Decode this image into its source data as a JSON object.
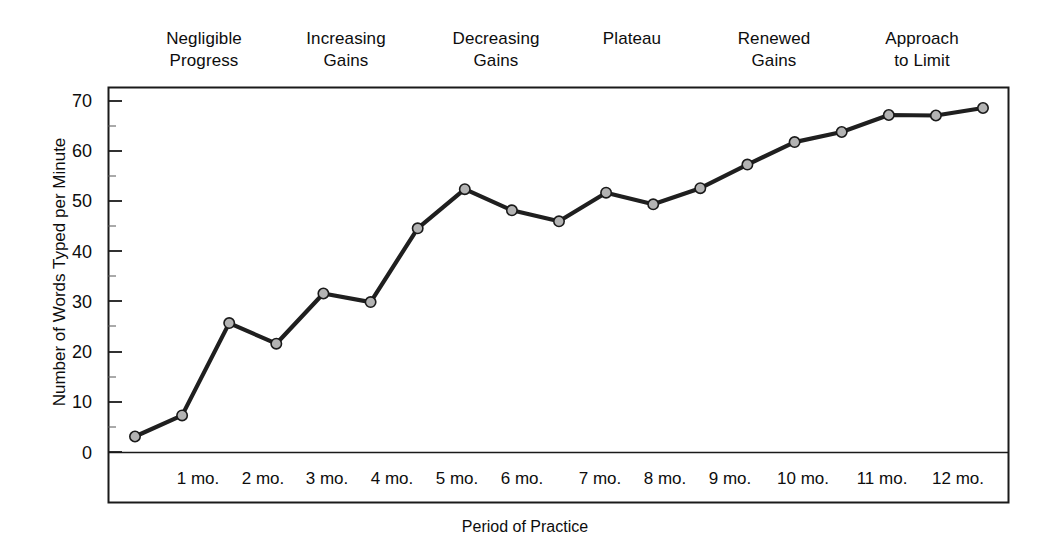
{
  "chart_data": {
    "type": "line",
    "title": "",
    "xlabel": "Period of Practice",
    "ylabel": "Number of Words Typed per Minute",
    "x_tick_labels": [
      "1 mo.",
      "2 mo.",
      "3 mo.",
      "4 mo.",
      "5 mo.",
      "6 mo.",
      "7 mo.",
      "8 mo.",
      "9 mo.",
      "10 mo.",
      "11 mo.",
      "12 mo."
    ],
    "y_tick_labels": [
      "0",
      "10",
      "20",
      "30",
      "40",
      "50",
      "60",
      "70"
    ],
    "y_ticks": [
      0,
      10,
      20,
      30,
      40,
      50,
      60,
      70
    ],
    "ylim": [
      0,
      72
    ],
    "grid": false,
    "legend": null,
    "marker": "circle",
    "line_color": "#1a1a1a",
    "marker_fill": "#b3b3b3",
    "marker_stroke": "#1a1a1a",
    "x": [
      0,
      1,
      2,
      3,
      4,
      5,
      6,
      7,
      8,
      9,
      10,
      11,
      12
    ],
    "values": [
      3.2,
      7.4,
      25.8,
      21.7,
      31.7,
      30.0,
      44.7,
      52.5,
      48.3,
      46.1,
      51.8,
      49.5,
      52.7
    ],
    "series": [
      {
        "name": "Words typed per minute",
        "points": [
          {
            "x": 0,
            "x_label": "",
            "y": 3.2
          },
          {
            "x": 1,
            "x_label": "1 mo.",
            "y": 7.4
          },
          {
            "x": 2,
            "x_label": "2 mo.",
            "y": 25.8
          },
          {
            "x": 3,
            "x_label": "",
            "y": 21.7
          },
          {
            "x": 4,
            "x_label": "3 mo.",
            "y": 31.7
          },
          {
            "x": 5,
            "x_label": "",
            "y": 30.0
          },
          {
            "x": 6,
            "x_label": "4 mo.",
            "y": 44.7
          },
          {
            "x": 7,
            "x_label": "",
            "y": 52.5
          },
          {
            "x": 8,
            "x_label": "5 mo.",
            "y": 48.3
          },
          {
            "x": 9,
            "x_label": "6 mo.",
            "y": 46.1
          },
          {
            "x": 10,
            "x_label": "7 mo.",
            "y": 51.8
          },
          {
            "x": 11,
            "x_label": "",
            "y": 49.5
          },
          {
            "x": 12,
            "x_label": "8 mo.",
            "y": 52.7
          },
          {
            "x": 13,
            "x_label": "9 mo.",
            "y": 57.4
          },
          {
            "x": 14,
            "x_label": "",
            "y": 61.9
          },
          {
            "x": 15,
            "x_label": "10 mo.",
            "y": 63.9
          },
          {
            "x": 16,
            "x_label": "11 mo.",
            "y": 67.3
          },
          {
            "x": 17,
            "x_label": "",
            "y": 67.2
          },
          {
            "x": 18,
            "x_label": "12 mo.",
            "y": 68.7
          }
        ]
      }
    ],
    "phase_annotations": [
      {
        "label": "Negligible\nProgress",
        "line1": "Negligible",
        "line2": "Progress"
      },
      {
        "label": "Increasing\nGains",
        "line1": "Increasing",
        "line2": "Gains"
      },
      {
        "label": "Decreasing\nGains",
        "line1": "Decreasing",
        "line2": "Gains"
      },
      {
        "label": "Plateau",
        "line1": "Plateau",
        "line2": ""
      },
      {
        "label": "Renewed\nGains",
        "line1": "Renewed",
        "line2": "Gains"
      },
      {
        "label": "Approach\nto Limit",
        "line1": "Approach",
        "line2": "to Limit"
      }
    ]
  },
  "phases": {
    "p0": "Negligible\nProgress",
    "p1": "Increasing\nGains",
    "p2": "Decreasing\nGains",
    "p3": "Plateau",
    "p4": "Renewed\nGains",
    "p5": "Approach\nto Limit"
  },
  "axes": {
    "y_title": "Number of Words Typed per Minute",
    "x_title": "Period of Practice",
    "y_labels": {
      "t0": "0",
      "t10": "10",
      "t20": "20",
      "t30": "30",
      "t40": "40",
      "t50": "50",
      "t60": "60",
      "t70": "70"
    },
    "x_labels": {
      "m1": "1 mo.",
      "m2": "2 mo.",
      "m3": "3 mo.",
      "m4": "4 mo.",
      "m5": "5 mo.",
      "m6": "6 mo.",
      "m7": "7 mo.",
      "m8": "8 mo.",
      "m9": "9 mo.",
      "m10": "10 mo.",
      "m11": "11 mo.",
      "m12": "12 mo."
    }
  },
  "colors": {
    "line": "#1a1a1a",
    "marker_fill": "#b3b3b3",
    "axis": "#1a1a1a",
    "text": "#0d0d0d",
    "background": "#ffffff"
  }
}
